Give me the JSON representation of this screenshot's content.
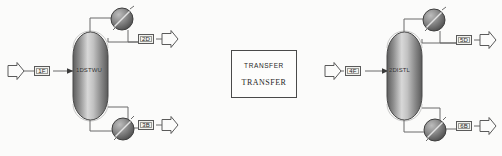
{
  "canvas": {
    "width": 502,
    "height": 156,
    "background": "#fbfbfa",
    "line_color": "#6b6b6b"
  },
  "note_box": {
    "line1": "TRANSFER",
    "line2": "TRANSFER"
  },
  "units": [
    {
      "id": "unit-left",
      "block_label": "1DSTWU",
      "feed_tag": "1F",
      "distillate_tag": "2D",
      "bottoms_tag": "3B",
      "condenser_name": "condenser-exchanger",
      "reboiler_name": "reboiler-exchanger"
    },
    {
      "id": "unit-right",
      "block_label": "2DISTL",
      "feed_tag": "4F",
      "distillate_tag": "5D",
      "bottoms_tag": "6B",
      "condenser_name": "condenser-exchanger",
      "reboiler_name": "reboiler-exchanger"
    }
  ],
  "icons": {
    "feed_arrow": "feed-arrow-icon",
    "product_arrow": "product-arrow-icon",
    "heat_exchanger": "heat-exchanger-icon",
    "column": "distillation-column-icon"
  }
}
